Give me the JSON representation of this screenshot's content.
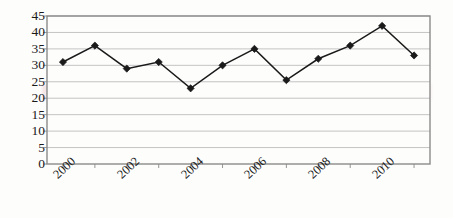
{
  "chart_data": {
    "type": "line",
    "title": "",
    "subtitle": "",
    "xlabel": "",
    "ylabel": "",
    "x": [
      2000,
      2001,
      2002,
      2003,
      2004,
      2005,
      2006,
      2007,
      2008,
      2009,
      2010,
      2011
    ],
    "values": [
      31,
      36,
      29,
      31,
      23,
      30,
      35,
      25.5,
      32,
      36,
      42,
      33
    ],
    "series": [
      {
        "name": "series-1",
        "values": [
          31,
          36,
          29,
          31,
          23,
          30,
          35,
          25.5,
          32,
          36,
          42,
          33
        ]
      }
    ],
    "x_tick_labels": [
      "2000",
      "2002",
      "2004",
      "2006",
      "2008",
      "2010"
    ],
    "x_tick_values": [
      2000,
      2002,
      2004,
      2006,
      2008,
      2010
    ],
    "y_tick_labels": [
      "45",
      "40",
      "35",
      "30",
      "25",
      "20",
      "15",
      "10",
      "5",
      "0"
    ],
    "y_tick_values": [
      45,
      40,
      35,
      30,
      25,
      20,
      15,
      10,
      5,
      0
    ],
    "xlim": [
      1999.5,
      2011.5
    ],
    "ylim": [
      0,
      45
    ],
    "grid": "horizontal",
    "legend": "none",
    "marker": "diamond",
    "colors": {
      "line": "#1a1a1a",
      "marker": "#1a1a1a",
      "grid": "#b5b5b5",
      "axis": "#8a8a8a",
      "plot_background": "#fdfdfc",
      "text": "#1a1a1a",
      "watermark": "#e2b4b4"
    }
  }
}
